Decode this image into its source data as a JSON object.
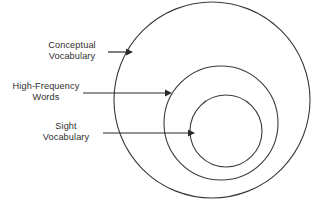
{
  "diagram": {
    "type": "nested-circles",
    "background_color": "#ffffff",
    "stroke_color": "#3b3b3b",
    "text_color": "#2f2f2f",
    "labels": {
      "conceptual": "Conceptual\nVocabulary",
      "high_frequency": "High-Frequency\nWords",
      "sight": "Sight\nVocabulary"
    },
    "rings": [
      {
        "name": "conceptual-vocabulary-circle",
        "label": "Conceptual Vocabulary",
        "cx": 212,
        "cy": 100,
        "r": 98
      },
      {
        "name": "high-frequency-words-circle",
        "label": "High-Frequency Words",
        "cx": 221,
        "cy": 123,
        "r": 57
      },
      {
        "name": "sight-vocabulary-circle",
        "label": "Sight Vocabulary",
        "cx": 226,
        "cy": 131,
        "r": 36
      }
    ],
    "connectors": [
      {
        "name": "conceptual-arrow",
        "x1": 108,
        "x2": 128,
        "y": 52
      },
      {
        "name": "high-frequency-arrow",
        "x1": 83,
        "x2": 167,
        "y": 93
      },
      {
        "name": "sight-arrow",
        "x1": 103,
        "x2": 190,
        "y": 133
      }
    ]
  }
}
